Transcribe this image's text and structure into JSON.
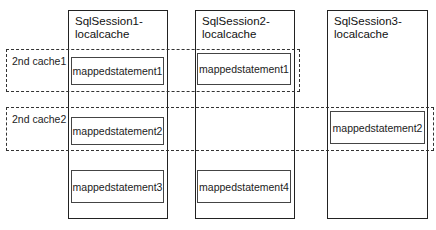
{
  "diagram": {
    "sessions": [
      {
        "title": "SqlSession1-\nlocalcache"
      },
      {
        "title": "SqlSession2-\nlocalcache"
      },
      {
        "title": "SqlSession3-\nlocalcache"
      }
    ],
    "caches": [
      {
        "label": "2nd cache1"
      },
      {
        "label": "2nd cache2"
      }
    ],
    "statements": {
      "s1_row1": "mappedstatement1",
      "s1_row2": "mappedstatement2",
      "s1_row3": "mappedstatement3",
      "s2_row1": "mappedstatement1",
      "s2_row3": "mappedstatement4",
      "s3_row2": "mappedstatement2"
    }
  }
}
